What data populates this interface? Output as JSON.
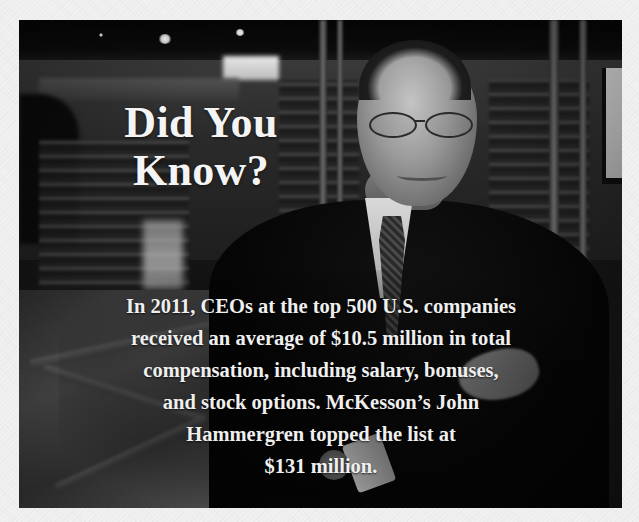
{
  "callout": {
    "title_lines": [
      "Did You",
      "Know?"
    ],
    "body_lines": [
      "In 2011, CEOs at the top 500 U.S. companies",
      "received an average of $10.5 million in total",
      "compensation, including salary, bonuses,",
      "and stock options. McKesson’s John",
      "Hammergren topped the list at",
      "$131 million."
    ],
    "photo_description": "Grayscale photo of a smiling man in glasses, dark suit and tie, arms crossed, standing in a store with shelves"
  },
  "colors": {
    "page_background": "#f1f1f1",
    "text": "#f4f4f4",
    "photo_tone": "grayscale"
  }
}
